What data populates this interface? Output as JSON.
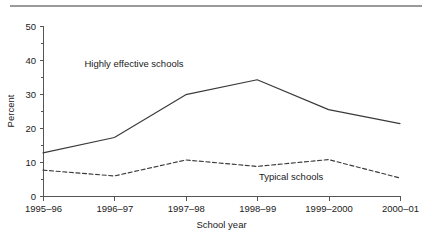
{
  "figure": {
    "rule_color": "#9a9a9a"
  },
  "chart_data": {
    "type": "line",
    "title": "",
    "xlabel": "School year",
    "ylabel": "Percent",
    "categories": [
      "1995–96",
      "1996–97",
      "1997–98",
      "1998–99",
      "1999–2000",
      "2000–01"
    ],
    "ylim": [
      0,
      50
    ],
    "yticks": [
      0,
      10,
      20,
      30,
      40,
      50
    ],
    "ytick_labels": [
      "0",
      "10",
      "20",
      "30",
      "40",
      "50"
    ],
    "grid": false,
    "legend_position": "inline-annotations",
    "series": [
      {
        "name": "Highly effective schools",
        "style": "solid",
        "color": "#3a3a3a",
        "values": [
          12.7,
          17.2,
          29.8,
          34.2,
          25.4,
          21.3
        ],
        "annotation": {
          "text": "Highly effective schools",
          "x_frac": 0.255,
          "y_value": 38.0
        }
      },
      {
        "name": "Typical schools",
        "style": "dashed",
        "color": "#3a3a3a",
        "values": [
          7.6,
          5.9,
          10.6,
          8.7,
          10.7,
          5.3
        ],
        "annotation": {
          "text": "Typical schools",
          "x_frac": 0.695,
          "y_value": 4.6
        }
      }
    ]
  }
}
